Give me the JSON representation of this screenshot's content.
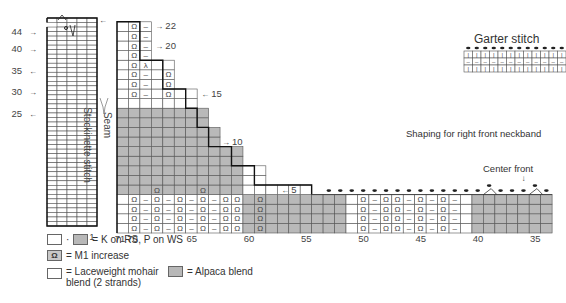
{
  "titles": {
    "garter": "Garter stitch",
    "neckband": "Shaping for right front neckband",
    "center_front": "Center front",
    "stockinette": "Stockinette stitch",
    "seam": "Seam"
  },
  "left_chart": {
    "row_labels": [
      {
        "text": "44",
        "row": 44,
        "arrow": "right"
      },
      {
        "text": "40",
        "row": 40,
        "arrow": "right"
      },
      {
        "text": "35",
        "row": 35,
        "arrow": "left"
      },
      {
        "text": "30",
        "row": 30,
        "arrow": "right"
      },
      {
        "text": "25",
        "row": 25,
        "arrow": "left"
      }
    ],
    "col_labels": [
      {
        "text": "5",
        "col": 5
      },
      {
        "text": "1",
        "col": 1
      }
    ]
  },
  "main_chart": {
    "row_labels": [
      {
        "text": "22",
        "row": 22,
        "arrow": "right"
      },
      {
        "text": "20",
        "row": 20,
        "arrow": "right"
      },
      {
        "text": "15",
        "row": 15,
        "arrow": "left"
      },
      {
        "text": "10",
        "row": 10,
        "arrow": "right"
      },
      {
        "text": "5",
        "row": 5,
        "arrow": "left"
      }
    ],
    "col_labels": [
      "71",
      "70",
      "65",
      "60",
      "55",
      "50",
      "45",
      "40",
      "35"
    ]
  },
  "legend": {
    "knit": "= K on RS, P on WS",
    "m1": "= M1 increase",
    "m1_symbol": "Ω",
    "mohair": "= Laceweight mohair",
    "mohair2": "blend (2 strands)",
    "alpaca": "= Alpaca blend",
    "dot": "·"
  },
  "colors": {
    "gray": "#b9b9b9",
    "line": "#555555",
    "thick": "#111111"
  }
}
